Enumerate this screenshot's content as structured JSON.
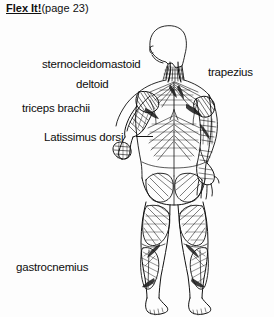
{
  "title": {
    "strong": "Flex It!",
    "paren": "(page 23)"
  },
  "figure": {
    "name": "human-muscular-system-back-view",
    "ink_color": "#111111",
    "background_color": "#fdfdfd"
  },
  "labels": [
    {
      "id": "sternocleidomastoid",
      "text": "sternocleidomastoid"
    },
    {
      "id": "deltoid",
      "text": "deltoid"
    },
    {
      "id": "triceps-brachii",
      "text": "triceps brachii"
    },
    {
      "id": "latissimus-dorsi",
      "text": "Latissimus dorsi"
    },
    {
      "id": "trapezius",
      "text": "trapezius"
    },
    {
      "id": "gastrocnemius",
      "text": "gastrocnemius"
    }
  ]
}
